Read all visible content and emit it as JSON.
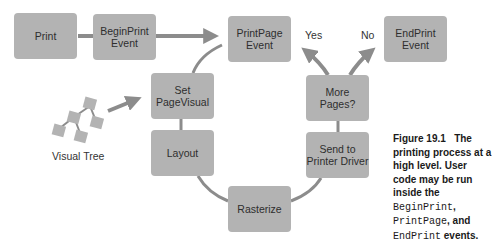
{
  "diagram": {
    "nodes": {
      "print": "Print",
      "begin_print": "BeginPrint\nEvent",
      "print_page": "PrintPage\nEvent",
      "end_print": "EndPrint\nEvent",
      "set_page_visual": "Set\nPageVisual",
      "more_pages": "More\nPages?",
      "layout": "Layout",
      "send_to_driver": "Send to\nPrinter Driver",
      "rasterize": "Rasterize"
    },
    "edge_labels": {
      "yes": "Yes",
      "no": "No"
    },
    "visual_tree_label": "Visual Tree",
    "colors": {
      "box": "#b3b3b3",
      "connector": "#8c8c8c",
      "text": "#2e2e2e"
    }
  },
  "caption": {
    "figure": "Figure 19.1",
    "text_1": "The printing process at a high level. User code may be run inside the",
    "code_1": "BeginPrint",
    "sep_1": ",",
    "code_2": "PrintPage",
    "sep_2": ", and",
    "code_3": "EndPrint",
    "text_2": "events."
  }
}
